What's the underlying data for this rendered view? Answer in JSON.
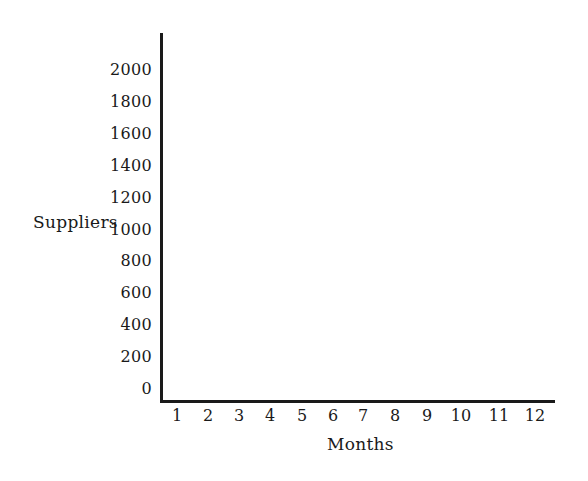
{
  "page": {
    "background_color": "#ffffff",
    "ink_color": "#1a1a1a"
  },
  "chart_data": {
    "type": "line",
    "title": "",
    "xlabel": "Months",
    "ylabel": "Suppliers",
    "categories": [
      1,
      2,
      3,
      4,
      5,
      6,
      7,
      8,
      9,
      10,
      11,
      12
    ],
    "series": [],
    "xlim": [
      0.5,
      12.5
    ],
    "ylim": [
      0,
      2200
    ],
    "yticks": [
      0,
      200,
      400,
      600,
      800,
      1000,
      1200,
      1400,
      1600,
      1800,
      2000
    ],
    "grid": false,
    "legend_position": "none",
    "tick_marks": false
  }
}
